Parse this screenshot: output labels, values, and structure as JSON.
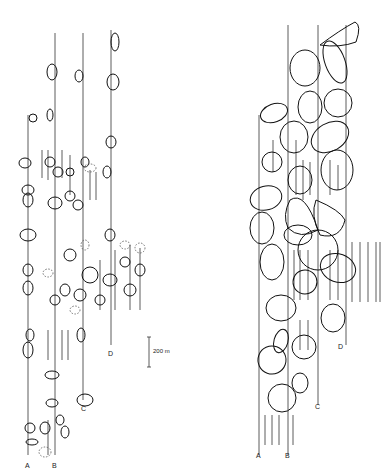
{
  "figure": {
    "left_panel": {
      "transect_labels": [
        "A",
        "B",
        "C",
        "D"
      ],
      "scale_bar_label": "200 m"
    },
    "right_panel": {
      "transect_labels": [
        "A",
        "B",
        "C",
        "D"
      ]
    }
  }
}
